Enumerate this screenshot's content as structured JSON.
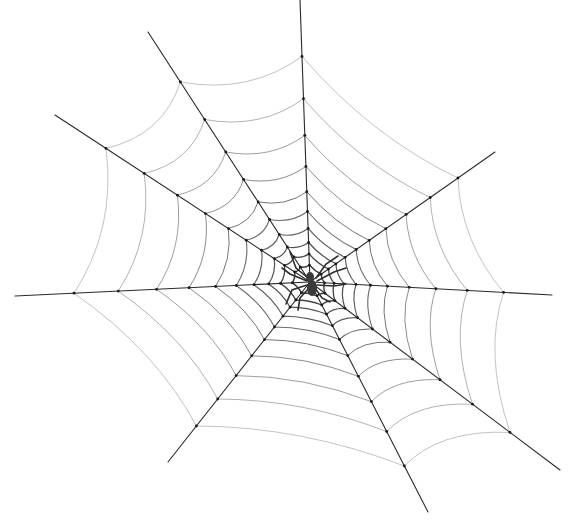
{
  "image": {
    "description": "Hand-drawn black ink spider web on white background with a spider at the hub",
    "width": 575,
    "height": 528,
    "background_color": "#ffffff",
    "ink_color": "#2a2a2a"
  },
  "web": {
    "hub": {
      "x": 310,
      "y": 282
    },
    "spokes": [
      {
        "name": "up",
        "x": 300,
        "y": 0
      },
      {
        "name": "up-left",
        "x": 148,
        "y": 32
      },
      {
        "name": "left-upper",
        "x": 55,
        "y": 115
      },
      {
        "name": "left",
        "x": 15,
        "y": 296
      },
      {
        "name": "down-left",
        "x": 168,
        "y": 462
      },
      {
        "name": "down",
        "x": 428,
        "y": 512
      },
      {
        "name": "down-right",
        "x": 560,
        "y": 470
      },
      {
        "name": "right",
        "x": 552,
        "y": 295
      },
      {
        "name": "up-right",
        "x": 495,
        "y": 152
      }
    ],
    "ring_fractions": [
      0.06,
      0.1,
      0.14,
      0.19,
      0.25,
      0.32,
      0.41,
      0.52,
      0.65,
      0.8
    ]
  },
  "spider": {
    "x": 312,
    "y": 282,
    "color": "#3a3a3a"
  }
}
